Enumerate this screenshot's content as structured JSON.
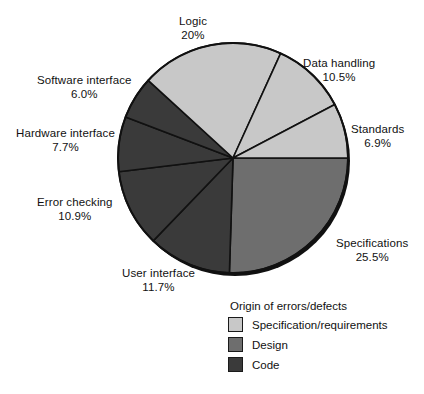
{
  "chart_data": {
    "type": "pie",
    "title": "",
    "legend_title": "Origin of errors/defects",
    "legend_position": "bottom-right",
    "total_labeled_percent": 99.2,
    "categories": [
      "Specifications",
      "Data handling",
      "Standards",
      "Logic",
      "Software interface",
      "Hardware interface",
      "Error checking",
      "User interface"
    ],
    "values": [
      25.5,
      10.5,
      6.9,
      20,
      6.0,
      7.7,
      10.9,
      11.7
    ],
    "slices": [
      {
        "name": "Specifications",
        "percent_label": "25.5%",
        "value": 25.5,
        "group": "Design",
        "color": "#6e6e6e",
        "start_deg": 0,
        "sweep_deg": 91.8,
        "label_x": 336,
        "label_y": 236,
        "label_align": "left"
      },
      {
        "name": "User interface",
        "percent_label": "11.7%",
        "value": 11.7,
        "group": "Code",
        "color": "#3a3a3a",
        "start_deg": 91.8,
        "sweep_deg": 42.12,
        "label_x": 122,
        "label_y": 266,
        "label_align": "center"
      },
      {
        "name": "Error checking",
        "percent_label": "10.9%",
        "value": 10.9,
        "group": "Code",
        "color": "#3a3a3a",
        "start_deg": 133.92,
        "sweep_deg": 39.24,
        "label_x": 37,
        "label_y": 195,
        "label_align": "center"
      },
      {
        "name": "Hardware interface",
        "percent_label": "7.7%",
        "value": 7.7,
        "group": "Code",
        "color": "#3a3a3a",
        "start_deg": 173.16,
        "sweep_deg": 27.72,
        "label_x": 16,
        "label_y": 126,
        "label_align": "center"
      },
      {
        "name": "Software interface",
        "percent_label": "6.0%",
        "value": 6.0,
        "group": "Code",
        "color": "#3a3a3a",
        "start_deg": 200.88,
        "sweep_deg": 21.6,
        "label_x": 37,
        "label_y": 73,
        "label_align": "center"
      },
      {
        "name": "Logic",
        "percent_label": "20%",
        "value": 20,
        "group": "Specification/requirements",
        "color": "#c8c8c8",
        "start_deg": 222.48,
        "sweep_deg": 72,
        "label_x": 179,
        "label_y": 14,
        "label_align": "center"
      },
      {
        "name": "Data handling",
        "percent_label": "10.5%",
        "value": 10.5,
        "group": "Specification/requirements",
        "color": "#c8c8c8",
        "start_deg": 294.48,
        "sweep_deg": 37.8,
        "label_x": 303,
        "label_y": 56,
        "label_align": "left"
      },
      {
        "name": "Standards",
        "percent_label": "6.9%",
        "value": 6.9,
        "group": "Specification/requirements",
        "color": "#c8c8c8",
        "start_deg": 332.28,
        "sweep_deg": 27.72,
        "label_x": 351,
        "label_y": 122,
        "label_align": "left"
      }
    ],
    "legend": [
      {
        "label": "Specification/requirements",
        "color": "#c8c8c8"
      },
      {
        "label": "Design",
        "color": "#6e6e6e"
      },
      {
        "label": "Code",
        "color": "#3a3a3a"
      }
    ],
    "geometry": {
      "center_x": 233,
      "center_y": 158,
      "radius": 115,
      "outline_color": "#111111"
    }
  }
}
